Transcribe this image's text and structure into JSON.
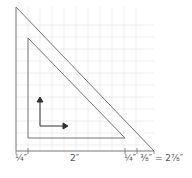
{
  "diagram": {
    "colors": {
      "line": "#777777",
      "grid": "#e2e2e2",
      "text": "#555555",
      "arrow": "#333333"
    },
    "labels": {
      "left_margin": "¼″",
      "inner_width": "2″",
      "right_margin": "¼″",
      "extra": "⅜″ = 2⅞″"
    }
  }
}
